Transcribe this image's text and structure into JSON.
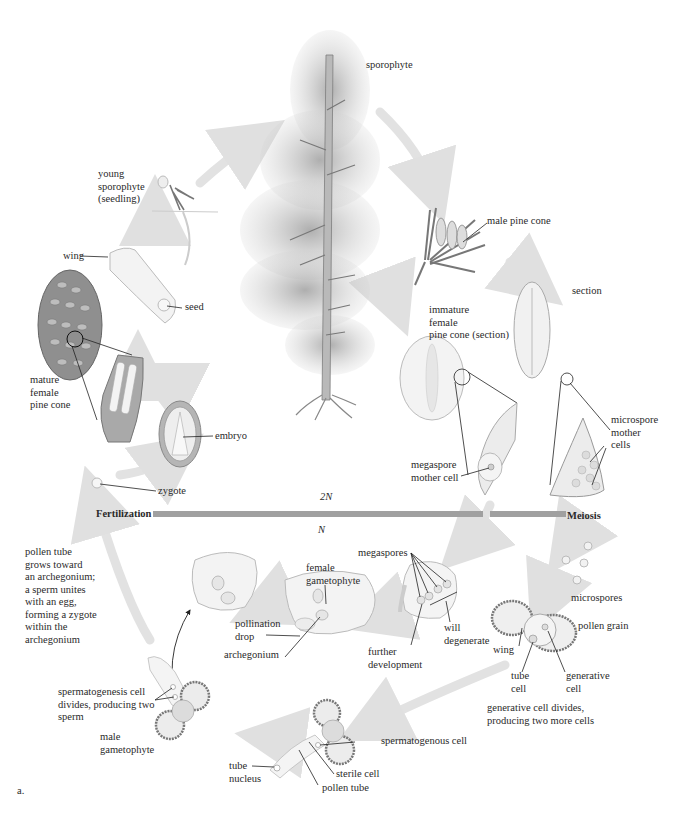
{
  "figure": {
    "panel_label": "a."
  },
  "phases": {
    "diploid": "2N",
    "haploid": "N",
    "fertilization": "Fertilization",
    "meiosis": "Meiosis"
  },
  "labels": {
    "sporophyte": "sporophyte",
    "male_pine_cone": "male pine cone",
    "section": "section",
    "immature_female_cone": "immature\nfemale\npine cone (section)",
    "microspore_mother_cells": "microspore\nmother\ncells",
    "megaspore_mother_cell": "megaspore\nmother cell",
    "young_sporophyte": "young\nsporophyte\n(seedling)",
    "wing_seed": "wing",
    "seed": "seed",
    "mature_female_cone": "mature\nfemale\npine cone",
    "embryo": "embryo",
    "zygote": "zygote",
    "megaspores": "megaspores",
    "will_degenerate": "will\ndegenerate",
    "further_development": "further\ndevelopment",
    "microspores": "microspores",
    "pollen_grain": "pollen grain",
    "wing_pollen": "wing",
    "tube_cell": "tube\ncell",
    "generative_cell": "generative\ncell",
    "generative_divides": "generative cell divides,\nproducing two more cells",
    "female_gametophyte": "female\ngametophyte",
    "pollination_drop": "pollination\ndrop",
    "archegonium": "archegonium",
    "pollen_tube_text": "pollen tube\ngrows toward\nan archegonium;\na sperm unites\nwith an egg,\nforming a zygote\nwithin the\narchegonium",
    "spermatogenesis": "spermatogenesis cell\ndivides, producing two\nsperm",
    "male_gametophyte": "male\ngametophyte",
    "spermatogenous_cell": "spermatogenous cell",
    "sterile_cell": "sterile cell",
    "pollen_tube": "pollen tube",
    "tube_nucleus": "tube\nnucleus"
  },
  "colors": {
    "background": "#ffffff",
    "phase_bar": "#9a9a9a",
    "cycle_arrow": "#e3e3e3",
    "ink": "#2a2a2a"
  }
}
